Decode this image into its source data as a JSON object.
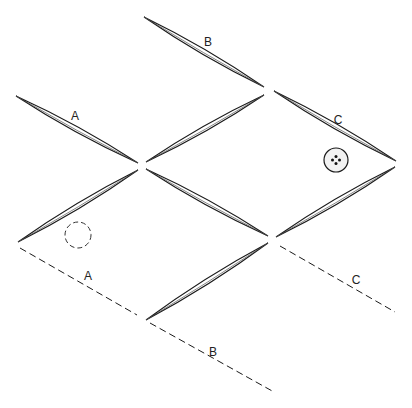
{
  "colors": {
    "stroke": "#1a1a1a",
    "background": "#ffffff",
    "buttonFill": "#f2f2f2"
  },
  "lenses": [
    {
      "id": "A-top",
      "x1": 16,
      "y1": 96,
      "x2": 138,
      "y2": 163,
      "w": 2.6
    },
    {
      "id": "B-top",
      "x1": 144,
      "y1": 17,
      "x2": 264,
      "y2": 87,
      "w": 2.6
    },
    {
      "id": "center-up",
      "x1": 146,
      "y1": 162,
      "x2": 264,
      "y2": 95,
      "w": 2.6
    },
    {
      "id": "C-top",
      "x1": 274,
      "y1": 91,
      "x2": 396,
      "y2": 161,
      "w": 2.6
    },
    {
      "id": "left-lower",
      "x1": 18,
      "y1": 242,
      "x2": 138,
      "y2": 170,
      "w": 2.6
    },
    {
      "id": "center-down",
      "x1": 146,
      "y1": 169,
      "x2": 268,
      "y2": 236,
      "w": 2.6
    },
    {
      "id": "right-lower",
      "x1": 276,
      "y1": 237,
      "x2": 395,
      "y2": 167,
      "w": 2.6
    },
    {
      "id": "bottom-up",
      "x1": 146,
      "y1": 320,
      "x2": 268,
      "y2": 243,
      "w": 2.6
    }
  ],
  "dashedLines": [
    {
      "id": "A-edge",
      "x1": 20,
      "y1": 248,
      "x2": 137,
      "y2": 315
    },
    {
      "id": "B-edge",
      "x1": 150,
      "y1": 323,
      "x2": 274,
      "y2": 392
    },
    {
      "id": "C-edge",
      "x1": 280,
      "y1": 246,
      "x2": 395,
      "y2": 312
    }
  ],
  "labels": [
    {
      "text": "A",
      "x": 75,
      "y": 120
    },
    {
      "text": "B",
      "x": 208,
      "y": 46
    },
    {
      "text": "C",
      "x": 338,
      "y": 124
    },
    {
      "text": "A",
      "x": 88,
      "y": 280
    },
    {
      "text": "B",
      "x": 213,
      "y": 356
    },
    {
      "text": "C",
      "x": 356,
      "y": 284
    }
  ],
  "button": {
    "cx": 336,
    "cy": 160,
    "r": 12,
    "holes": 4
  },
  "placementMarker": {
    "cx": 78,
    "cy": 235,
    "r": 13,
    "style": "dashed"
  }
}
